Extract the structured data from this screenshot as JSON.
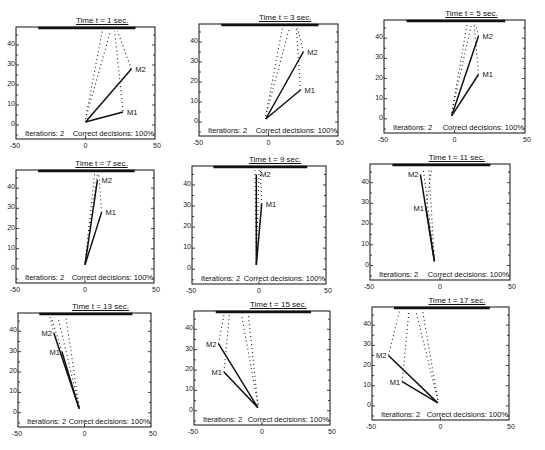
{
  "chart_data": [
    {
      "type": "line",
      "title": "Time t = 1 sec.",
      "xlim": [
        -50,
        50
      ],
      "ylim": [
        -7,
        49
      ],
      "xticks": [
        "-50",
        "0",
        "50"
      ],
      "yticks": [
        "0",
        "10",
        "20",
        "30",
        "40"
      ],
      "annotations": {
        "iterations": "Iterations: 2",
        "correct": "Correct decisions: 100%"
      },
      "series": [
        {
          "name": "M1",
          "points": [
            [
              0,
              1.5
            ],
            [
              27,
              6.5
            ]
          ]
        },
        {
          "name": "M2",
          "points": [
            [
              0,
              1.5
            ],
            [
              33,
              28
            ]
          ]
        }
      ],
      "dotted": [
        [
          [
            0,
            3
          ],
          [
            12,
            47
          ]
        ],
        [
          [
            0,
            3
          ],
          [
            18,
            47
          ]
        ],
        [
          [
            27,
            7
          ],
          [
            21,
            47
          ]
        ],
        [
          [
            33,
            28
          ],
          [
            23,
            47
          ]
        ]
      ]
    },
    {
      "type": "line",
      "title": "Time t = 3 sec.",
      "xlim": [
        -50,
        50
      ],
      "ylim": [
        -7,
        49
      ],
      "xticks": [
        "-50",
        "0",
        "50"
      ],
      "yticks": [
        "0",
        "10",
        "20",
        "30",
        "40"
      ],
      "annotations": {
        "iterations": "Iterations: 2",
        "correct": "Correct decisions: 100%"
      },
      "series": [
        {
          "name": "M1",
          "points": [
            [
              -2,
              1.5
            ],
            [
              23,
              16
            ]
          ]
        },
        {
          "name": "M2",
          "points": [
            [
              -2,
              1.5
            ],
            [
              25,
              35
            ]
          ]
        }
      ],
      "dotted": [
        [
          [
            -2,
            3
          ],
          [
            10,
            47
          ]
        ],
        [
          [
            -2,
            3
          ],
          [
            15,
            47
          ]
        ],
        [
          [
            23,
            16
          ],
          [
            20,
            47
          ]
        ],
        [
          [
            25,
            35
          ],
          [
            21,
            47
          ]
        ]
      ]
    },
    {
      "type": "line",
      "title": "Time t = 5 sec.",
      "xlim": [
        -50,
        50
      ],
      "ylim": [
        -7,
        49
      ],
      "xticks": [
        "-50",
        "0",
        "50"
      ],
      "yticks": [
        "0",
        "10",
        "20",
        "30",
        "40"
      ],
      "annotations": {
        "iterations": "Iterations: 2",
        "correct": "Correct decisions: 100%"
      },
      "series": [
        {
          "name": "M1",
          "points": [
            [
              -2,
              1.5
            ],
            [
              17,
              22
            ]
          ]
        },
        {
          "name": "M2",
          "points": [
            [
              -2,
              1.5
            ],
            [
              17,
              41
            ]
          ]
        }
      ],
      "dotted": [
        [
          [
            -2,
            3
          ],
          [
            9,
            47
          ]
        ],
        [
          [
            -2,
            3
          ],
          [
            12,
            47
          ]
        ],
        [
          [
            17,
            22
          ],
          [
            14,
            47
          ]
        ],
        [
          [
            17,
            41
          ],
          [
            15,
            47
          ]
        ]
      ]
    },
    {
      "type": "line",
      "title": "Time t = 7 sec.",
      "xlim": [
        -50,
        50
      ],
      "ylim": [
        -7,
        49
      ],
      "xticks": [
        "-50",
        "0",
        "50"
      ],
      "yticks": [
        "0",
        "10",
        "20",
        "30",
        "40"
      ],
      "annotations": {
        "iterations": "Iterations: 2",
        "correct": "Correct decisions: 100%"
      },
      "series": [
        {
          "name": "M1",
          "points": [
            [
              0,
              2
            ],
            [
              12,
              28
            ]
          ]
        },
        {
          "name": "M2",
          "points": [
            [
              0,
              2
            ],
            [
              9,
              44
            ]
          ]
        }
      ],
      "dotted": [
        [
          [
            0,
            3
          ],
          [
            7,
            47
          ]
        ],
        [
          [
            0,
            3
          ],
          [
            9,
            47
          ]
        ],
        [
          [
            12,
            28
          ],
          [
            10,
            47
          ]
        ]
      ]
    },
    {
      "type": "line",
      "title": "Time t = 9 sec.",
      "xlim": [
        -50,
        50
      ],
      "ylim": [
        -7,
        49
      ],
      "xticks": [
        "-50",
        "0",
        "50"
      ],
      "yticks": [
        "0",
        "10",
        "20",
        "30",
        "40"
      ],
      "annotations": {
        "iterations": "Iterations: 2",
        "correct": "Correct decisions: 100%"
      },
      "series": [
        {
          "name": "M1",
          "points": [
            [
              -2,
              2
            ],
            [
              2,
              31
            ]
          ]
        },
        {
          "name": "M2",
          "points": [
            [
              -2,
              2
            ],
            [
              -2,
              45
            ]
          ]
        }
      ],
      "dotted": [
        [
          [
            -2,
            3
          ],
          [
            -3,
            47
          ]
        ],
        [
          [
            -2,
            3
          ],
          [
            0,
            47
          ]
        ],
        [
          [
            2,
            31
          ],
          [
            1,
            47
          ]
        ]
      ]
    },
    {
      "type": "line",
      "title": "Time t = 11 sec.",
      "xlim": [
        -50,
        50
      ],
      "ylim": [
        -7,
        49
      ],
      "xticks": [
        "-50",
        "0",
        "50"
      ],
      "yticks": [
        "0",
        "10",
        "20",
        "30",
        "40"
      ],
      "annotations": {
        "iterations": "Iterations: 2",
        "correct": "Correct decisions: 100%"
      },
      "series": [
        {
          "name": "M1",
          "points": [
            [
              -4,
              2
            ],
            [
              -10,
              28
            ]
          ]
        },
        {
          "name": "M2",
          "points": [
            [
              -4,
              2
            ],
            [
              -14,
              44
            ]
          ]
        }
      ],
      "dotted": [
        [
          [
            -4,
            3
          ],
          [
            -12,
            47
          ]
        ],
        [
          [
            -4,
            3
          ],
          [
            -8,
            47
          ]
        ],
        [
          [
            -10,
            28
          ],
          [
            -6,
            47
          ]
        ]
      ]
    },
    {
      "type": "line",
      "title": "Time t = 13 sec.",
      "xlim": [
        -50,
        50
      ],
      "ylim": [
        -7,
        49
      ],
      "xticks": [
        "-50",
        "0",
        "50"
      ],
      "yticks": [
        "0",
        "10",
        "20",
        "30",
        "40"
      ],
      "annotations": {
        "iterations": "Iterations: 2",
        "correct": "Correct decisions: 100%"
      },
      "series": [
        {
          "name": "M1",
          "points": [
            [
              -4,
              2
            ],
            [
              -17,
              30
            ]
          ]
        },
        {
          "name": "M2",
          "points": [
            [
              -4,
              2
            ],
            [
              -23,
              39
            ]
          ]
        }
      ],
      "dotted": [
        [
          [
            -4,
            3
          ],
          [
            -20,
            47
          ]
        ],
        [
          [
            -4,
            3
          ],
          [
            -14,
            47
          ]
        ],
        [
          [
            -17,
            30
          ],
          [
            -25,
            47
          ]
        ],
        [
          [
            -23,
            39
          ],
          [
            -26,
            47
          ]
        ]
      ]
    },
    {
      "type": "line",
      "title": "Time t = 15 sec.",
      "xlim": [
        -50,
        50
      ],
      "ylim": [
        -7,
        49
      ],
      "xticks": [
        "-50",
        "0",
        "50"
      ],
      "yticks": [
        "0",
        "10",
        "20",
        "30",
        "40"
      ],
      "annotations": {
        "iterations": "Iterations: 2",
        "correct": "Correct decisions: 100%"
      },
      "series": [
        {
          "name": "M1",
          "points": [
            [
              -3,
              1.5
            ],
            [
              -28,
              19
            ]
          ]
        },
        {
          "name": "M2",
          "points": [
            [
              -3,
              1.5
            ],
            [
              -32,
              33
            ]
          ]
        }
      ],
      "dotted": [
        [
          [
            -3,
            3
          ],
          [
            -15,
            47
          ]
        ],
        [
          [
            -3,
            3
          ],
          [
            -10,
            47
          ]
        ],
        [
          [
            -28,
            19
          ],
          [
            -24,
            47
          ]
        ],
        [
          [
            -32,
            33
          ],
          [
            -28,
            47
          ]
        ]
      ]
    },
    {
      "type": "line",
      "title": "Time t = 17 sec.",
      "xlim": [
        -50,
        50
      ],
      "ylim": [
        -7,
        49
      ],
      "xticks": [
        "-50",
        "0",
        "50"
      ],
      "yticks": [
        "0",
        "10",
        "20",
        "30",
        "40"
      ],
      "annotations": {
        "iterations": "Iterations: 2",
        "correct": "Correct decisions: 100%"
      },
      "series": [
        {
          "name": "M1",
          "points": [
            [
              -2,
              1.5
            ],
            [
              -28,
              12
            ]
          ]
        },
        {
          "name": "M2",
          "points": [
            [
              -2,
              1.5
            ],
            [
              -38,
              25
            ]
          ]
        }
      ],
      "dotted": [
        [
          [
            -2,
            3
          ],
          [
            -18,
            47
          ]
        ],
        [
          [
            -2,
            3
          ],
          [
            -13,
            47
          ]
        ],
        [
          [
            -28,
            12
          ],
          [
            -23,
            47
          ]
        ],
        [
          [
            -38,
            25
          ],
          [
            -30,
            47
          ]
        ]
      ]
    }
  ],
  "layout": {
    "panels": [
      {
        "left": 16,
        "top": 27,
        "right": 155,
        "bottom": 139
      },
      {
        "left": 199,
        "top": 24,
        "right": 338,
        "bottom": 136
      },
      {
        "left": 384,
        "top": 20,
        "right": 525,
        "bottom": 133
      },
      {
        "left": 16,
        "top": 170,
        "right": 154,
        "bottom": 283
      },
      {
        "left": 192,
        "top": 166,
        "right": 326,
        "bottom": 284
      },
      {
        "left": 370,
        "top": 164,
        "right": 510,
        "bottom": 280
      },
      {
        "left": 18,
        "top": 313,
        "right": 151,
        "bottom": 427
      },
      {
        "left": 194,
        "top": 311,
        "right": 330,
        "bottom": 425
      },
      {
        "left": 372,
        "top": 307,
        "right": 509,
        "bottom": 420
      }
    ]
  }
}
